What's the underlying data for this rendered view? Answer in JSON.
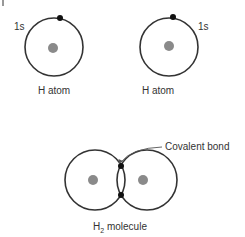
{
  "diagram": {
    "atoms": [
      {
        "label": "H atom",
        "orbital_label": "1s"
      },
      {
        "label": "H atom",
        "orbital_label": "1s"
      }
    ],
    "molecule": {
      "label_main": "H",
      "label_sub": "2",
      "label_rest": " molecule",
      "annotation": "Covalent bond"
    },
    "colors": {
      "orbital": "#333333",
      "electron": "#111111",
      "nucleus": "#8a8a8a",
      "arrow": "#555555"
    }
  }
}
